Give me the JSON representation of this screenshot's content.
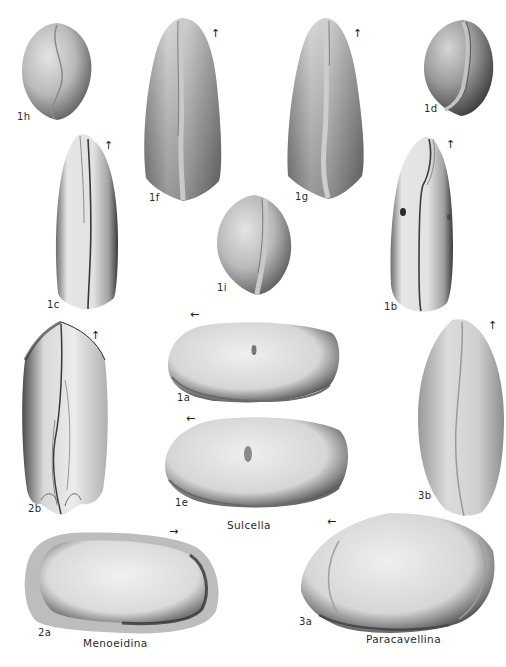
{
  "plate": {
    "description": "Plate of ostracod specimens (fossil figures) with view labels and genus names",
    "background_color": "#ffffff",
    "ink_color": "#2a2a2a"
  },
  "figures": [
    {
      "id": "1h",
      "label": "1h",
      "view": "end view (rounded)",
      "genus": "Sulcella",
      "orientation_arrow": "none"
    },
    {
      "id": "1f",
      "label": "1f",
      "view": "dorsal view (tapered)",
      "genus": "Sulcella",
      "orientation_arrow": "up"
    },
    {
      "id": "1g",
      "label": "1g",
      "view": "ventral view (tapered)",
      "genus": "Sulcella",
      "orientation_arrow": "up"
    },
    {
      "id": "1d",
      "label": "1d",
      "view": "end view (rounded)",
      "genus": "Sulcella",
      "orientation_arrow": "none"
    },
    {
      "id": "1c",
      "label": "1c",
      "view": "dorsal view (elongate)",
      "genus": "Sulcella",
      "orientation_arrow": "up"
    },
    {
      "id": "1i",
      "label": "1i",
      "view": "end view (rounded)",
      "genus": "Sulcella",
      "orientation_arrow": "none"
    },
    {
      "id": "1b",
      "label": "1b",
      "view": "ventral view (elongate)",
      "genus": "Sulcella",
      "orientation_arrow": "up"
    },
    {
      "id": "2b",
      "label": "2b",
      "view": "dorsal view",
      "genus": "Menoeidina",
      "orientation_arrow": "up"
    },
    {
      "id": "1a",
      "label": "1a",
      "view": "lateral view",
      "genus": "Sulcella",
      "orientation_arrow": "left"
    },
    {
      "id": "1e",
      "label": "1e",
      "view": "lateral view",
      "genus": "Sulcella",
      "orientation_arrow": "left"
    },
    {
      "id": "3b",
      "label": "3b",
      "view": "dorsal view",
      "genus": "Paracavellina",
      "orientation_arrow": "up"
    },
    {
      "id": "2a",
      "label": "2a",
      "view": "lateral view",
      "genus": "Menoeidina",
      "orientation_arrow": "right"
    },
    {
      "id": "3a",
      "label": "3a",
      "view": "lateral view",
      "genus": "Paracavellina",
      "orientation_arrow": "left"
    }
  ],
  "labels": {
    "1h": "1h",
    "1f": "1f",
    "1g": "1g",
    "1d": "1d",
    "1c": "1c",
    "1i": "1i",
    "1b": "1b",
    "2b": "2b",
    "1a": "1a",
    "1e": "1e",
    "3b": "3b",
    "2a": "2a",
    "3a": "3a"
  },
  "genus_names": {
    "sulcella": "Sulcella",
    "menoeidina": "Menoeidina",
    "paracavellina": "Paracavellina"
  },
  "arrows": {
    "up": "↑",
    "left": "←",
    "right": "→"
  }
}
